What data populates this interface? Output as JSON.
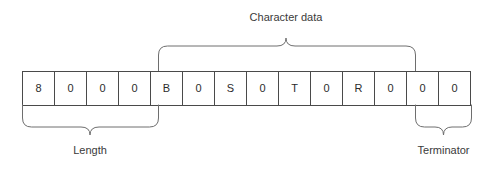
{
  "diagram": {
    "title_visible": false,
    "background_color": "#ffffff",
    "cell_border_color": "#4a4a4a",
    "brace_color": "#6e6e6e",
    "text_color": "#2b2b2b"
  },
  "memory_layout": {
    "cells": [
      {
        "index": 0,
        "value": "8"
      },
      {
        "index": 1,
        "value": "0"
      },
      {
        "index": 2,
        "value": "0"
      },
      {
        "index": 3,
        "value": "0"
      },
      {
        "index": 4,
        "value": "B"
      },
      {
        "index": 5,
        "value": "0"
      },
      {
        "index": 6,
        "value": "S"
      },
      {
        "index": 7,
        "value": "0"
      },
      {
        "index": 8,
        "value": "T"
      },
      {
        "index": 9,
        "value": "0"
      },
      {
        "index": 10,
        "value": "R"
      },
      {
        "index": 11,
        "value": "0"
      },
      {
        "index": 12,
        "value": "0"
      },
      {
        "index": 13,
        "value": "0"
      }
    ]
  },
  "annotations": {
    "top": [
      {
        "id": "character-data",
        "label": "Character data",
        "start_cell": 4,
        "end_cell": 11,
        "position": "above"
      }
    ],
    "bottom": [
      {
        "id": "length",
        "label": "Length",
        "start_cell": 0,
        "end_cell": 3,
        "position": "below"
      },
      {
        "id": "terminator",
        "label": "Terminator",
        "start_cell": 12,
        "end_cell": 13,
        "position": "below"
      }
    ]
  }
}
